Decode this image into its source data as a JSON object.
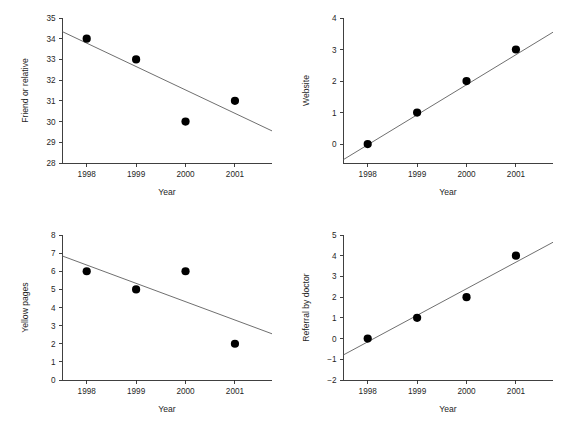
{
  "figure": {
    "background": "#ffffff",
    "layout": "2x2 panel grid of scatter plots with fitted regression lines",
    "point_color": "#000000",
    "line_color": "#555555",
    "axis_color": "#2b2b2b"
  },
  "chart_data": [
    {
      "id": "friend-or-relative",
      "panel": "top-left",
      "type": "scatter",
      "title": "",
      "xlabel": "Year",
      "ylabel": "Friend or relative",
      "categories": [
        "1998",
        "1999",
        "2000",
        "2001"
      ],
      "x": [
        1998,
        1999,
        2000,
        2001
      ],
      "values": [
        34,
        33,
        30,
        31
      ],
      "xlim": [
        1997.5,
        2001.75
      ],
      "ylim": [
        28,
        35
      ],
      "yticks": [
        28,
        29,
        30,
        31,
        32,
        33,
        34,
        35
      ],
      "xticks": [
        1998,
        1999,
        2000,
        2001
      ],
      "grid": false,
      "legend": "none",
      "trend": {
        "type": "linear-fit",
        "x_start": 1997.5,
        "x_end": 2001.75,
        "y_start": 34.35,
        "y_end": 29.55
      }
    },
    {
      "id": "website",
      "panel": "top-right",
      "type": "scatter",
      "title": "",
      "xlabel": "Year",
      "ylabel": "Website",
      "categories": [
        "1998",
        "1999",
        "2000",
        "2001"
      ],
      "x": [
        1998,
        1999,
        2000,
        2001
      ],
      "values": [
        0,
        1,
        2,
        3
      ],
      "xlim": [
        1997.5,
        2001.75
      ],
      "ylim": [
        -0.6,
        4
      ],
      "yticks": [
        0,
        1,
        2,
        3,
        4
      ],
      "xticks": [
        1998,
        1999,
        2000,
        2001
      ],
      "grid": false,
      "legend": "none",
      "trend": {
        "type": "linear-fit",
        "x_start": 1997.5,
        "x_end": 2001.75,
        "y_start": -0.5,
        "y_end": 3.55
      }
    },
    {
      "id": "yellow-pages",
      "panel": "bottom-left",
      "type": "scatter",
      "title": "",
      "xlabel": "Year",
      "ylabel": "Yellow pages",
      "categories": [
        "1998",
        "1999",
        "2000",
        "2001"
      ],
      "x": [
        1998,
        1999,
        2000,
        2001
      ],
      "values": [
        6,
        5,
        6,
        2
      ],
      "xlim": [
        1997.5,
        2001.75
      ],
      "ylim": [
        0,
        8
      ],
      "yticks": [
        0,
        1,
        2,
        3,
        4,
        5,
        6,
        7,
        8
      ],
      "xticks": [
        1998,
        1999,
        2000,
        2001
      ],
      "grid": false,
      "legend": "none",
      "trend": {
        "type": "linear-fit",
        "x_start": 1997.5,
        "x_end": 2001.75,
        "y_start": 6.85,
        "y_end": 2.55
      }
    },
    {
      "id": "referral-by-doctor",
      "panel": "bottom-right",
      "type": "scatter",
      "title": "",
      "xlabel": "Year",
      "ylabel": "Referral by doctor",
      "categories": [
        "1998",
        "1999",
        "2000",
        "2001"
      ],
      "x": [
        1998,
        1999,
        2000,
        2001
      ],
      "values": [
        0,
        1,
        2,
        4
      ],
      "xlim": [
        1997.5,
        2001.75
      ],
      "ylim": [
        -2,
        5
      ],
      "yticks": [
        -2,
        -1,
        0,
        1,
        2,
        3,
        4,
        5
      ],
      "xticks": [
        1998,
        1999,
        2000,
        2001
      ],
      "grid": false,
      "legend": "none",
      "trend": {
        "type": "linear-fit",
        "x_start": 1997.5,
        "x_end": 2001.75,
        "y_start": -0.8,
        "y_end": 4.65
      }
    }
  ]
}
